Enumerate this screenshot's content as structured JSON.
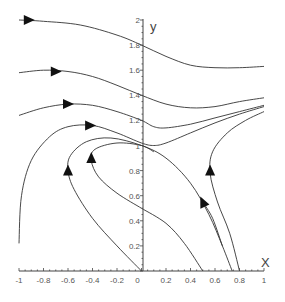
{
  "chart_data": {
    "type": "line",
    "subtype": "phase-portrait",
    "title": "",
    "xlabel": "X",
    "ylabel": "y",
    "xlim": [
      -1,
      1
    ],
    "ylim": [
      0,
      2
    ],
    "grid": false,
    "x_ticks": [
      "-1",
      "-0.8",
      "-0.6",
      "-0.4",
      "-0.2",
      "0",
      "0.2",
      "0.4",
      "0.6",
      "0.8",
      "1"
    ],
    "y_ticks": [
      "0.2",
      "0.4",
      "0.6",
      "0.8",
      "1",
      "1.2",
      "1.4",
      "1.6",
      "1.8",
      "2"
    ],
    "series": [
      {
        "name": "trajectory-1",
        "points": [
          [
            -1,
            2.0
          ],
          [
            -0.8,
            1.99
          ],
          [
            -0.5,
            1.96
          ],
          [
            -0.2,
            1.88
          ],
          [
            0,
            1.8
          ],
          [
            0.2,
            1.71
          ],
          [
            0.4,
            1.64
          ],
          [
            0.6,
            1.62
          ],
          [
            0.8,
            1.62
          ],
          [
            1,
            1.63
          ]
        ],
        "arrow": {
          "at": [
            -0.92,
            2.0
          ],
          "direction": "right"
        }
      },
      {
        "name": "trajectory-2",
        "points": [
          [
            -1,
            1.58
          ],
          [
            -0.8,
            1.6
          ],
          [
            -0.6,
            1.59
          ],
          [
            -0.4,
            1.55
          ],
          [
            -0.2,
            1.48
          ],
          [
            0,
            1.4
          ],
          [
            0.2,
            1.33
          ],
          [
            0.4,
            1.3
          ],
          [
            0.6,
            1.31
          ],
          [
            0.8,
            1.35
          ],
          [
            1,
            1.38
          ]
        ],
        "arrow": {
          "at": [
            -0.7,
            1.59
          ],
          "direction": "right"
        }
      },
      {
        "name": "trajectory-3",
        "points": [
          [
            -1,
            1.24
          ],
          [
            -0.8,
            1.3
          ],
          [
            -0.6,
            1.33
          ],
          [
            -0.4,
            1.32
          ],
          [
            -0.2,
            1.27
          ],
          [
            0,
            1.2
          ],
          [
            0.1,
            1.15
          ],
          [
            0.2,
            1.14
          ],
          [
            0.4,
            1.17
          ],
          [
            0.6,
            1.22
          ],
          [
            0.8,
            1.27
          ],
          [
            1,
            1.32
          ]
        ],
        "arrow": {
          "at": [
            -0.6,
            1.33
          ],
          "direction": "right"
        }
      },
      {
        "name": "trajectory-4",
        "points": [
          [
            -1,
            0.22
          ],
          [
            -0.98,
            0.6
          ],
          [
            -0.9,
            0.88
          ],
          [
            -0.75,
            1.07
          ],
          [
            -0.6,
            1.15
          ],
          [
            -0.4,
            1.16
          ],
          [
            -0.2,
            1.1
          ],
          [
            0,
            1.02
          ],
          [
            0.1,
            1.0
          ],
          [
            0.2,
            1.02
          ],
          [
            0.4,
            1.1
          ],
          [
            0.6,
            1.18
          ],
          [
            0.8,
            1.25
          ],
          [
            1,
            1.31
          ]
        ],
        "arrow": {
          "at": [
            -0.42,
            1.16
          ],
          "direction": "right"
        }
      },
      {
        "name": "trajectory-5",
        "points": [
          [
            0,
            0.0
          ],
          [
            -0.2,
            0.2
          ],
          [
            -0.4,
            0.42
          ],
          [
            -0.55,
            0.65
          ],
          [
            -0.6,
            0.8
          ],
          [
            -0.58,
            0.92
          ],
          [
            -0.45,
            1.03
          ],
          [
            -0.25,
            1.06
          ],
          [
            0,
            1.0
          ],
          [
            0.2,
            0.9
          ],
          [
            0.4,
            0.7
          ],
          [
            0.55,
            0.45
          ],
          [
            0.66,
            0.2
          ],
          [
            0.74,
            0.0
          ]
        ],
        "arrow": {
          "at": [
            -0.6,
            0.8
          ],
          "direction": "up"
        }
      },
      {
        "name": "trajectory-6",
        "points": [
          [
            0,
            0.5
          ],
          [
            -0.2,
            0.62
          ],
          [
            -0.35,
            0.75
          ],
          [
            -0.41,
            0.88
          ],
          [
            -0.38,
            0.97
          ],
          [
            -0.2,
            1.02
          ],
          [
            0,
            1.0
          ],
          [
            0.1,
            0.95
          ]
        ],
        "arrow": {
          "at": [
            -0.41,
            0.9
          ],
          "direction": "up"
        }
      },
      {
        "name": "trajectory-7",
        "points": [
          [
            0,
            0.5
          ],
          [
            0.2,
            0.38
          ],
          [
            0.35,
            0.22
          ],
          [
            0.5,
            0.0
          ]
        ],
        "arrow": null
      },
      {
        "name": "trajectory-8",
        "points": [
          [
            0.8,
            0.0
          ],
          [
            0.72,
            0.3
          ],
          [
            0.62,
            0.55
          ],
          [
            0.56,
            0.78
          ],
          [
            0.58,
            0.95
          ],
          [
            0.7,
            1.1
          ],
          [
            0.85,
            1.2
          ],
          [
            1,
            1.27
          ]
        ],
        "arrow": {
          "at": [
            0.56,
            0.8
          ],
          "direction": "up"
        }
      },
      {
        "name": "trajectory-9",
        "points": [
          [
            0.66,
            0.2
          ],
          [
            0.58,
            0.42
          ],
          [
            0.5,
            0.55
          ]
        ],
        "arrow": {
          "at": [
            0.5,
            0.55
          ],
          "direction": "up-left"
        }
      }
    ]
  },
  "axes": {
    "x_label": "X",
    "y_label": "y",
    "x_tick_labels": [
      "-1",
      "-0.8",
      "-0.6",
      "-0.4",
      "-0.2",
      "0",
      "0.2",
      "0.4",
      "0.6",
      "0.8",
      "1"
    ],
    "y_tick_labels": [
      "0.2",
      "0.4",
      "0.6",
      "0.8",
      "1",
      "1.2",
      "1.4",
      "1.6",
      "1.8",
      "2"
    ]
  }
}
